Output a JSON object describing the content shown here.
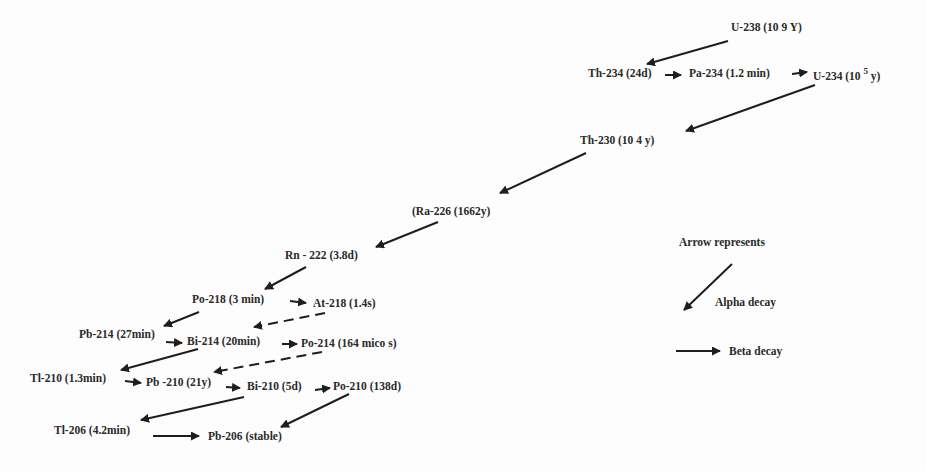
{
  "diagram": {
    "nodes": [
      {
        "id": "u238",
        "label": "U-238 (10 9 Y)",
        "x": 731,
        "y": 28
      },
      {
        "id": "th234",
        "label": "Th-234 (24d)",
        "x": 588,
        "y": 70
      },
      {
        "id": "pa234",
        "label": "Pa-234 (1.2 min)",
        "x": 689,
        "y": 70
      },
      {
        "id": "u234",
        "label": "U-234 (10",
        "sup": "5",
        "tail": "y)",
        "x": 813,
        "y": 69
      },
      {
        "id": "th230",
        "label": "Th-230 (10 4 y)",
        "x": 580,
        "y": 140
      },
      {
        "id": "ra226",
        "label": "(Ra-226 (1662y)",
        "x": 412,
        "y": 211
      },
      {
        "id": "rn222",
        "label": "Rn - 222 (3.8d)",
        "x": 285,
        "y": 255
      },
      {
        "id": "po218",
        "label": "Po-218 (3 min)",
        "x": 192,
        "y": 296
      },
      {
        "id": "at218",
        "label": "At-218 (1.4s)",
        "x": 313,
        "y": 301
      },
      {
        "id": "pb214",
        "label": "Pb-214 (27min)",
        "x": 79,
        "y": 331
      },
      {
        "id": "bi214",
        "label": "Bi-214 (20min)",
        "x": 187,
        "y": 337
      },
      {
        "id": "po214",
        "label": "Po-214 (164 mico s)",
        "x": 301,
        "y": 339
      },
      {
        "id": "tl210",
        "label": "Tl-210 (1.3min)",
        "x": 30,
        "y": 374
      },
      {
        "id": "pb210",
        "label": "Pb -210 (21y)",
        "x": 146,
        "y": 378
      },
      {
        "id": "bi210",
        "label": "Bi-210 (5d)",
        "x": 247,
        "y": 381
      },
      {
        "id": "po210",
        "label": "Po-210 (138d)",
        "x": 333,
        "y": 381
      },
      {
        "id": "tl206",
        "label": "Tl-206 (4.2min)",
        "x": 54,
        "y": 426
      },
      {
        "id": "pb206",
        "label": "Pb-206 (stable)",
        "x": 208,
        "y": 431
      }
    ],
    "edges": [
      {
        "from": "u238",
        "to": "th234",
        "type": "alpha"
      },
      {
        "from": "th234",
        "to": "pa234",
        "type": "beta"
      },
      {
        "from": "pa234",
        "to": "u234",
        "type": "beta"
      },
      {
        "from": "u234",
        "to": "th230",
        "type": "alpha"
      },
      {
        "from": "th230",
        "to": "ra226",
        "type": "alpha"
      },
      {
        "from": "ra226",
        "to": "rn222",
        "type": "alpha"
      },
      {
        "from": "rn222",
        "to": "po218",
        "type": "alpha"
      },
      {
        "from": "po218",
        "to": "at218",
        "type": "beta"
      },
      {
        "from": "po218",
        "to": "pb214",
        "type": "alpha"
      },
      {
        "from": "at218",
        "to": "bi214",
        "type": "alpha-dashed"
      },
      {
        "from": "pb214",
        "to": "bi214",
        "type": "beta"
      },
      {
        "from": "bi214",
        "to": "po214",
        "type": "beta"
      },
      {
        "from": "bi214",
        "to": "tl210",
        "type": "alpha"
      },
      {
        "from": "po214",
        "to": "pb210",
        "type": "alpha-dashed"
      },
      {
        "from": "tl210",
        "to": "pb210",
        "type": "beta"
      },
      {
        "from": "pb210",
        "to": "bi210",
        "type": "beta"
      },
      {
        "from": "bi210",
        "to": "po210",
        "type": "beta"
      },
      {
        "from": "bi210",
        "to": "tl206",
        "type": "alpha"
      },
      {
        "from": "po210",
        "to": "pb206",
        "type": "alpha"
      },
      {
        "from": "tl206",
        "to": "pb206",
        "type": "beta"
      }
    ]
  },
  "legend": {
    "title": "Arrow represents",
    "alpha_label": "Alpha decay",
    "beta_label": "Beta decay"
  },
  "colors": {
    "ink": "#1e1e1e",
    "text": "#2a2a2a",
    "background": "#fdfdfd"
  }
}
